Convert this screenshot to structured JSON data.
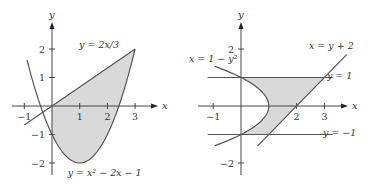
{
  "chart_data": [
    {
      "type": "area",
      "title": "",
      "xlabel": "x",
      "ylabel": "y",
      "xlim": [
        -1.4,
        3.8
      ],
      "ylim": [
        -2.5,
        2.8
      ],
      "x_ticks": [
        {
          "v": -1,
          "label": "−1"
        },
        {
          "v": 1,
          "label": "1"
        },
        {
          "v": 2,
          "label": "2"
        },
        {
          "v": 3,
          "label": "3"
        }
      ],
      "y_ticks": [
        {
          "v": 2,
          "label": "2"
        },
        {
          "v": 1,
          "label": "1"
        },
        {
          "v": -1,
          "label": "−1"
        },
        {
          "v": -2,
          "label": "−2"
        }
      ],
      "curves": [
        {
          "name": "y = 2x/3",
          "kind": "y_of_x",
          "a": 0,
          "b": 0.6667,
          "c": 0,
          "domain": [
            -1,
            3
          ]
        },
        {
          "name": "y = x² − 2x − 1",
          "kind": "y_of_x_quad",
          "a": 1,
          "b": -2,
          "c": -1,
          "domain": [
            -0.9,
            3
          ]
        }
      ],
      "shaded_region": {
        "between": [
          "y = 2x/3",
          "y = x² − 2x − 1"
        ],
        "x_range": [
          0,
          3
        ]
      },
      "annotations": [
        {
          "text": "y = 2x/3",
          "at": [
            1.7,
            2.05
          ]
        },
        {
          "text": "y = x² − 2x − 1",
          "at": [
            1.9,
            -2.45
          ]
        }
      ],
      "shade_color": "#d9d9d9",
      "line_color": "#555555"
    },
    {
      "type": "area",
      "title": "",
      "xlabel": "x",
      "ylabel": "y",
      "xlim": [
        -1.4,
        3.8
      ],
      "ylim": [
        -2.5,
        2.8
      ],
      "x_ticks": [
        {
          "v": -1,
          "label": "−1"
        },
        {
          "v": 2,
          "label": "2"
        },
        {
          "v": 3,
          "label": "3"
        }
      ],
      "y_ticks": [
        {
          "v": 2,
          "label": "2"
        },
        {
          "v": -2,
          "label": "−2"
        }
      ],
      "curves": [
        {
          "name": "x = 1 − y²",
          "kind": "x_of_y_quad",
          "domain_y": [
            -1.4,
            1.4
          ]
        },
        {
          "name": "x = y + 2",
          "kind": "x_of_y_line",
          "domain_y": [
            -1.4,
            1.8
          ]
        },
        {
          "name": "y = 1",
          "kind": "hline",
          "value": 1,
          "x_range": [
            -1.2,
            3.3
          ]
        },
        {
          "name": "y = −1",
          "kind": "hline",
          "value": -1,
          "x_range": [
            -1.2,
            3.3
          ]
        }
      ],
      "shaded_region": {
        "between": [
          "x = 1 − y²",
          "x = y + 2"
        ],
        "y_range": [
          -1,
          1
        ]
      },
      "annotations": [
        {
          "text": "x = 1 − y²",
          "at": [
            -1.0,
            1.55
          ]
        },
        {
          "text": "x = y + 2",
          "at": [
            3.25,
            2.0
          ]
        },
        {
          "text": "y = 1",
          "at": [
            3.55,
            0.95
          ]
        },
        {
          "text": "y = −1",
          "at": [
            3.55,
            -1.05
          ]
        }
      ],
      "shade_color": "#d9d9d9",
      "line_color": "#555555"
    }
  ]
}
